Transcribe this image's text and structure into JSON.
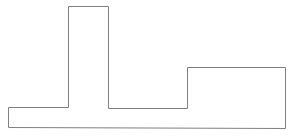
{
  "diagram": {
    "type": "outline-shape",
    "stroke_color": "#808080",
    "fill_color": "#ffffff",
    "stroke_width": 1,
    "polygon_points": [
      [
        8,
        107
      ],
      [
        68,
        107
      ],
      [
        68,
        6
      ],
      [
        108,
        6
      ],
      [
        108,
        108
      ],
      [
        187,
        108
      ],
      [
        187,
        67
      ],
      [
        285,
        67
      ],
      [
        285,
        128
      ],
      [
        8,
        127
      ]
    ],
    "segments": [
      {
        "name": "left-base-block",
        "x": 8,
        "y": 107,
        "w": 60,
        "h": 20
      },
      {
        "name": "tall-column",
        "x": 68,
        "y": 6,
        "w": 40,
        "h": 101
      },
      {
        "name": "middle-base-block",
        "x": 108,
        "y": 108,
        "w": 79,
        "h": 20
      },
      {
        "name": "right-raised-block",
        "x": 187,
        "y": 67,
        "w": 98,
        "h": 61
      }
    ]
  }
}
